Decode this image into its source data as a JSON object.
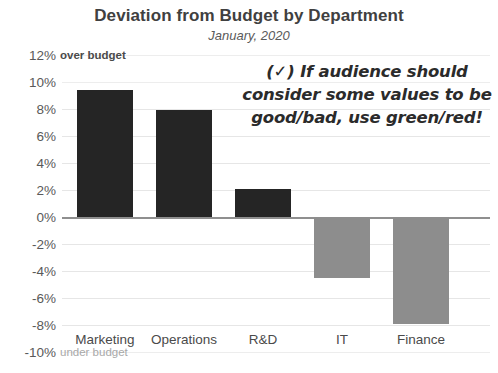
{
  "chart_data": {
    "type": "bar",
    "title": "Deviation from Budget by Department",
    "subtitle": "January, 2020",
    "xlabel": "",
    "ylabel": "",
    "categories": [
      "Marketing",
      "Operations",
      "R&D",
      "IT",
      "Finance"
    ],
    "values": [
      9.4,
      7.9,
      2.1,
      -4.5,
      -7.9
    ],
    "ylim": [
      -10,
      12
    ],
    "ytick_labels": [
      "12%",
      "10%",
      "8%",
      "6%",
      "4%",
      "2%",
      "0%",
      "-2%",
      "-4%",
      "-6%",
      "-8%",
      "-10%"
    ],
    "ytick_values": [
      12,
      10,
      8,
      6,
      4,
      2,
      0,
      -2,
      -4,
      -6,
      -8,
      -10
    ],
    "grid": true,
    "legend": "none",
    "axis_notes": {
      "top_label": "over budget",
      "bottom_label": "under budget"
    },
    "colors": {
      "positive_bar": "#252525",
      "negative_bar": "#8d8d8d",
      "gridline": "#e6e6e6",
      "zero_line": "#8f8f8f",
      "title": "#404040"
    },
    "annotation": {
      "check_mark": "(✓)",
      "lines": [
        "(✓) If audience should",
        "consider some values to be",
        "good/bad, use green/red!"
      ]
    }
  }
}
